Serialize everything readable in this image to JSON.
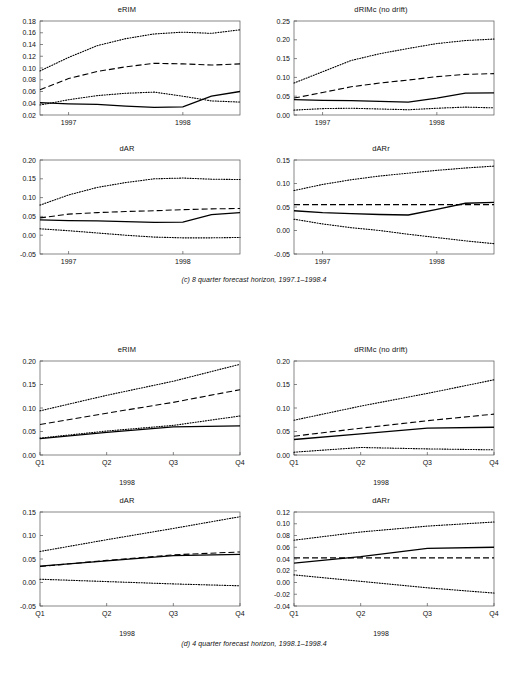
{
  "figure": {
    "width": 508,
    "height": 678,
    "line_colors": {
      "solid": "#000000",
      "dashed": "#000000",
      "dotted": "#000000"
    }
  },
  "panels": [
    {
      "id": "panel-c",
      "caption": "(c) 8 quarter forecast horizon, 1997.1–1998.4",
      "xlabel": "",
      "charts": [
        {
          "id": "c-erim",
          "chart_data": {
            "type": "line",
            "title": "eRIM",
            "xlabel": "",
            "ylabel": "",
            "xlim": [
              0,
              7
            ],
            "ylim": [
              0.02,
              0.18
            ],
            "yticks": [
              0.02,
              0.04,
              0.06,
              0.08,
              0.1,
              0.12,
              0.14,
              0.16,
              0.18
            ],
            "ytick_labels": [
              "0.02",
              "0.04",
              "0.06",
              "0.08",
              "0.10",
              "0.12",
              "0.14",
              "0.16",
              "0.18"
            ],
            "xticks": [
              1,
              5
            ],
            "xtick_labels": [
              "1997",
              "1998"
            ],
            "x": [
              0,
              1,
              2,
              3,
              4,
              5,
              6,
              7
            ],
            "grid": false,
            "legend": "none",
            "series": [
              {
                "name": "upper outer band",
                "style": "dotted",
                "values": [
                  0.095,
                  0.118,
                  0.138,
                  0.15,
                  0.158,
                  0.161,
                  0.159,
                  0.165
                ]
              },
              {
                "name": "upper inner band",
                "style": "dashed",
                "values": [
                  0.063,
                  0.082,
                  0.094,
                  0.102,
                  0.108,
                  0.107,
                  0.105,
                  0.107
                ]
              },
              {
                "name": "lower inner band",
                "style": "dotted",
                "values": [
                  0.037,
                  0.046,
                  0.053,
                  0.057,
                  0.059,
                  0.052,
                  0.044,
                  0.042
                ]
              },
              {
                "name": "actual",
                "style": "solid",
                "values": [
                  0.041,
                  0.039,
                  0.038,
                  0.035,
                  0.033,
                  0.034,
                  0.052,
                  0.06
                ]
              }
            ]
          }
        },
        {
          "id": "c-drimc",
          "chart_data": {
            "type": "line",
            "title": "dRIMc (no drift)",
            "xlabel": "",
            "ylabel": "",
            "xlim": [
              0,
              7
            ],
            "ylim": [
              0.0,
              0.25
            ],
            "yticks": [
              0.0,
              0.05,
              0.1,
              0.15,
              0.2,
              0.25
            ],
            "ytick_labels": [
              "0.00",
              "0.05",
              "0.10",
              "0.15",
              "0.20",
              "0.25"
            ],
            "xticks": [
              1,
              5
            ],
            "xtick_labels": [
              "1997",
              "1998"
            ],
            "x": [
              0,
              1,
              2,
              3,
              4,
              5,
              6,
              7
            ],
            "grid": false,
            "legend": "none",
            "series": [
              {
                "name": "upper outer band",
                "style": "dotted",
                "values": [
                  0.085,
                  0.115,
                  0.145,
                  0.163,
                  0.177,
                  0.19,
                  0.198,
                  0.202
                ]
              },
              {
                "name": "upper inner band",
                "style": "dashed",
                "values": [
                  0.045,
                  0.06,
                  0.075,
                  0.085,
                  0.093,
                  0.102,
                  0.108,
                  0.11
                ]
              },
              {
                "name": "lower inner band",
                "style": "dotted",
                "values": [
                  0.013,
                  0.017,
                  0.018,
                  0.016,
                  0.014,
                  0.018,
                  0.021,
                  0.019
                ]
              },
              {
                "name": "actual",
                "style": "solid",
                "values": [
                  0.041,
                  0.039,
                  0.038,
                  0.036,
                  0.034,
                  0.045,
                  0.058,
                  0.059
                ]
              }
            ]
          }
        }
      ],
      "charts2": [
        {
          "id": "c-dar",
          "chart_data": {
            "type": "line",
            "title": "dAR",
            "xlabel": "",
            "ylabel": "",
            "xlim": [
              0,
              7
            ],
            "ylim": [
              -0.05,
              0.2
            ],
            "yticks": [
              -0.05,
              0.0,
              0.05,
              0.1,
              0.15,
              0.2
            ],
            "ytick_labels": [
              "-0.05",
              "0.00",
              "0.05",
              "0.10",
              "0.15",
              "0.20"
            ],
            "xticks": [
              1,
              5
            ],
            "xtick_labels": [
              "1997",
              "1998"
            ],
            "x": [
              0,
              1,
              2,
              3,
              4,
              5,
              6,
              7
            ],
            "grid": false,
            "legend": "none",
            "series": [
              {
                "name": "upper outer band",
                "style": "dotted",
                "values": [
                  0.08,
                  0.107,
                  0.127,
                  0.14,
                  0.15,
                  0.152,
                  0.149,
                  0.148
                ]
              },
              {
                "name": "upper inner band",
                "style": "dashed",
                "values": [
                  0.046,
                  0.056,
                  0.06,
                  0.063,
                  0.065,
                  0.068,
                  0.07,
                  0.071
                ]
              },
              {
                "name": "lower inner band",
                "style": "dotted",
                "values": [
                  0.017,
                  0.012,
                  0.006,
                  0.0,
                  -0.005,
                  -0.007,
                  -0.007,
                  -0.006
                ]
              },
              {
                "name": "actual",
                "style": "solid",
                "values": [
                  0.041,
                  0.039,
                  0.038,
                  0.036,
                  0.034,
                  0.035,
                  0.055,
                  0.06
                ]
              }
            ]
          }
        },
        {
          "id": "c-darr",
          "chart_data": {
            "type": "line",
            "title": "dARr",
            "xlabel": "",
            "ylabel": "",
            "xlim": [
              0,
              7
            ],
            "ylim": [
              -0.05,
              0.15
            ],
            "yticks": [
              -0.05,
              0.0,
              0.05,
              0.1,
              0.15
            ],
            "ytick_labels": [
              "-0.05",
              "0.00",
              "0.05",
              "0.10",
              "0.15"
            ],
            "xticks": [
              1,
              5
            ],
            "xtick_labels": [
              "1997",
              "1998"
            ],
            "x": [
              0,
              1,
              2,
              3,
              4,
              5,
              6,
              7
            ],
            "grid": false,
            "legend": "none",
            "series": [
              {
                "name": "upper outer band",
                "style": "dotted",
                "values": [
                  0.085,
                  0.098,
                  0.108,
                  0.116,
                  0.122,
                  0.128,
                  0.133,
                  0.137
                ]
              },
              {
                "name": "upper inner band",
                "style": "dashed",
                "values": [
                  0.055,
                  0.055,
                  0.055,
                  0.055,
                  0.055,
                  0.055,
                  0.055,
                  0.055
                ]
              },
              {
                "name": "lower inner band",
                "style": "dotted",
                "values": [
                  0.024,
                  0.014,
                  0.006,
                  0.0,
                  -0.008,
                  -0.015,
                  -0.022,
                  -0.028
                ]
              },
              {
                "name": "actual",
                "style": "solid",
                "values": [
                  0.042,
                  0.038,
                  0.036,
                  0.034,
                  0.033,
                  0.045,
                  0.058,
                  0.06
                ]
              }
            ]
          }
        }
      ]
    },
    {
      "id": "panel-d",
      "caption": "(d) 4 quarter forecast horizon, 1998.1–1998.4",
      "xlabel": "1998",
      "charts": [
        {
          "id": "d-erim",
          "chart_data": {
            "type": "line",
            "title": "eRIM",
            "xlabel": "1998",
            "ylabel": "",
            "xlim": [
              0,
              3
            ],
            "ylim": [
              0.0,
              0.2
            ],
            "yticks": [
              0.0,
              0.05,
              0.1,
              0.15,
              0.2
            ],
            "ytick_labels": [
              "0.00",
              "0.05",
              "0.10",
              "0.15",
              "0.20"
            ],
            "xticks": [
              0,
              1,
              2,
              3
            ],
            "xtick_labels": [
              "Q1",
              "Q2",
              "Q3",
              "Q4"
            ],
            "x": [
              0,
              1,
              2,
              3
            ],
            "grid": false,
            "legend": "none",
            "series": [
              {
                "name": "upper outer band",
                "style": "dotted",
                "values": [
                  0.094,
                  0.127,
                  0.157,
                  0.193
                ]
              },
              {
                "name": "upper inner band",
                "style": "dashed",
                "values": [
                  0.065,
                  0.089,
                  0.112,
                  0.139
                ]
              },
              {
                "name": "lower inner band",
                "style": "dotted",
                "values": [
                  0.036,
                  0.051,
                  0.063,
                  0.083
                ]
              },
              {
                "name": "actual",
                "style": "solid",
                "values": [
                  0.035,
                  0.048,
                  0.06,
                  0.062
                ]
              }
            ]
          }
        },
        {
          "id": "d-drimc",
          "chart_data": {
            "type": "line",
            "title": "dRIMc (no drift)",
            "xlabel": "1998",
            "ylabel": "",
            "xlim": [
              0,
              3
            ],
            "ylim": [
              0.0,
              0.2
            ],
            "yticks": [
              0.0,
              0.05,
              0.1,
              0.15,
              0.2
            ],
            "ytick_labels": [
              "0.00",
              "0.05",
              "0.10",
              "0.15",
              "0.20"
            ],
            "xticks": [
              0,
              1,
              2,
              3
            ],
            "xtick_labels": [
              "Q1",
              "Q2",
              "Q3",
              "Q4"
            ],
            "x": [
              0,
              1,
              2,
              3
            ],
            "grid": false,
            "legend": "none",
            "series": [
              {
                "name": "upper outer band",
                "style": "dotted",
                "values": [
                  0.074,
                  0.104,
                  0.131,
                  0.16
                ]
              },
              {
                "name": "upper inner band",
                "style": "dashed",
                "values": [
                  0.04,
                  0.057,
                  0.073,
                  0.087
                ]
              },
              {
                "name": "lower inner band",
                "style": "dotted",
                "values": [
                  0.006,
                  0.016,
                  0.013,
                  0.011
                ]
              },
              {
                "name": "actual",
                "style": "solid",
                "values": [
                  0.033,
                  0.045,
                  0.057,
                  0.059
                ]
              }
            ]
          }
        }
      ],
      "charts2": [
        {
          "id": "d-dar",
          "chart_data": {
            "type": "line",
            "title": "dAR",
            "xlabel": "1998",
            "ylabel": "",
            "xlim": [
              0,
              3
            ],
            "ylim": [
              -0.05,
              0.15
            ],
            "yticks": [
              -0.05,
              0.0,
              0.05,
              0.1,
              0.15
            ],
            "ytick_labels": [
              "-0.05",
              "0.00",
              "0.05",
              "0.10",
              "0.15"
            ],
            "xticks": [
              0,
              1,
              2,
              3
            ],
            "xtick_labels": [
              "Q1",
              "Q2",
              "Q3",
              "Q4"
            ],
            "x": [
              0,
              1,
              2,
              3
            ],
            "grid": false,
            "legend": "none",
            "series": [
              {
                "name": "upper outer band",
                "style": "dotted",
                "values": [
                  0.066,
                  0.091,
                  0.115,
                  0.14
                ]
              },
              {
                "name": "upper inner band",
                "style": "dashed",
                "values": [
                  0.034,
                  0.047,
                  0.059,
                  0.065
                ]
              },
              {
                "name": "lower inner band",
                "style": "dotted",
                "values": [
                  0.007,
                  0.002,
                  -0.003,
                  -0.007
                ]
              },
              {
                "name": "actual",
                "style": "solid",
                "values": [
                  0.035,
                  0.046,
                  0.057,
                  0.06
                ]
              }
            ]
          }
        },
        {
          "id": "d-darr",
          "chart_data": {
            "type": "line",
            "title": "dARr",
            "xlabel": "1998",
            "ylabel": "",
            "xlim": [
              0,
              3
            ],
            "ylim": [
              -0.04,
              0.12
            ],
            "yticks": [
              -0.04,
              -0.02,
              0.0,
              0.02,
              0.04,
              0.06,
              0.08,
              0.1,
              0.12
            ],
            "ytick_labels": [
              "-0.04",
              "-0.02",
              "0.00",
              "0.02",
              "0.04",
              "0.06",
              "0.08",
              "0.10",
              "0.12"
            ],
            "xticks": [
              0,
              1,
              2,
              3
            ],
            "xtick_labels": [
              "Q1",
              "Q2",
              "Q3",
              "Q4"
            ],
            "x": [
              0,
              1,
              2,
              3
            ],
            "grid": false,
            "legend": "none",
            "series": [
              {
                "name": "upper outer band",
                "style": "dotted",
                "values": [
                  0.072,
                  0.086,
                  0.096,
                  0.103
                ]
              },
              {
                "name": "upper inner band",
                "style": "dashed",
                "values": [
                  0.042,
                  0.042,
                  0.042,
                  0.042
                ]
              },
              {
                "name": "lower inner band",
                "style": "dotted",
                "values": [
                  0.013,
                  0.002,
                  -0.009,
                  -0.018
                ]
              },
              {
                "name": "actual",
                "style": "solid",
                "values": [
                  0.033,
                  0.044,
                  0.058,
                  0.06
                ]
              }
            ]
          }
        }
      ]
    }
  ]
}
